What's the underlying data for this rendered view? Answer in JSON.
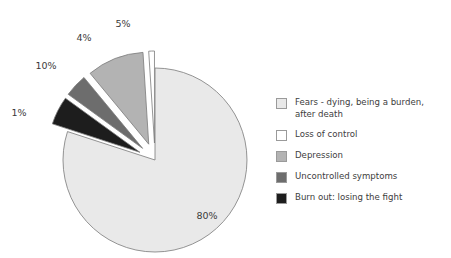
{
  "chart_data": {
    "type": "pie",
    "title": "",
    "subtitle": "",
    "xlabel": "",
    "ylabel": "",
    "grid": false,
    "legend_position": "right",
    "units": "percent",
    "categories": [
      "Fears - dying, being a burden, after death",
      "Loss of control",
      "Depression",
      "Uncontrolled symptoms",
      "Burn out: losing the fight"
    ],
    "values": [
      80,
      1,
      10,
      4,
      5
    ],
    "data_labels": [
      "80%",
      "1%",
      "10%",
      "4%",
      "5%"
    ],
    "colors": [
      "#e9e9e9",
      "#ffffff",
      "#b3b3b3",
      "#6d6d6d",
      "#1d1d1d"
    ],
    "exploded": [
      false,
      true,
      true,
      true,
      true
    ],
    "slices": [
      {
        "label": "Fears - dying, being a burden, after death",
        "value": 80,
        "data_label": "80%",
        "color": "#e9e9e9",
        "exploded": false
      },
      {
        "label": "Loss of control",
        "value": 1,
        "data_label": "1%",
        "color": "#ffffff",
        "exploded": true
      },
      {
        "label": "Depression",
        "value": 10,
        "data_label": "10%",
        "color": "#b3b3b3",
        "exploded": true
      },
      {
        "label": "Uncontrolled symptoms",
        "value": 4,
        "data_label": "4%",
        "color": "#6d6d6d",
        "exploded": true
      },
      {
        "label": "Burn out: losing the fight",
        "value": 5,
        "data_label": "5%",
        "color": "#1d1d1d",
        "exploded": true
      }
    ]
  },
  "labels": {
    "pct_80": "80%",
    "pct_1": "1%",
    "pct_10": "10%",
    "pct_4": "4%",
    "pct_5": "5%"
  },
  "legend": {
    "items": [
      {
        "label": "Fears - dying, being a burden,\nafter death",
        "color": "#e9e9e9"
      },
      {
        "label": "Loss of control",
        "color": "#ffffff"
      },
      {
        "label": "Depression",
        "color": "#b3b3b3"
      },
      {
        "label": "Uncontrolled symptoms",
        "color": "#6d6d6d"
      },
      {
        "label": "Burn out: losing the fight",
        "color": "#1d1d1d"
      }
    ]
  },
  "style": {
    "background": "#ffffff",
    "slice_outline": "#7a7a7a",
    "label_color": "#3a3a3a"
  }
}
